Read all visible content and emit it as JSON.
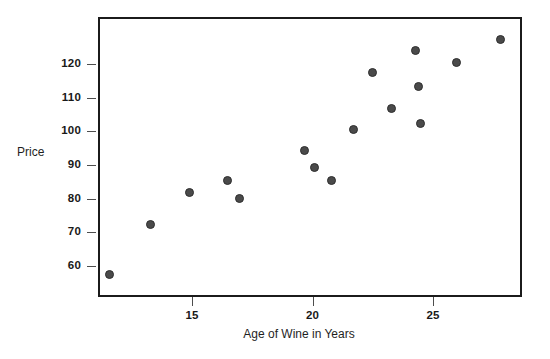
{
  "chart_data": {
    "type": "scatter",
    "title": "",
    "xlabel": "Age of Wine in Years",
    "ylabel": "Price",
    "xlim": [
      11.2,
      28.6
    ],
    "ylim": [
      55.5,
      131
    ],
    "grid": false,
    "legend": null,
    "xticks": [
      15,
      20,
      25
    ],
    "yticks": [
      60,
      70,
      80,
      90,
      100,
      110,
      120
    ],
    "xtick_labels": [
      "15",
      "20",
      "25"
    ],
    "ytick_labels": [
      "60",
      "70",
      "80",
      "90",
      "100",
      "110",
      "120"
    ],
    "marker": {
      "shape": "circle",
      "color": "#4a4a4a",
      "edge_color": "#2e2e2e",
      "size": 9
    },
    "x": [
      11.5,
      13.2,
      14.8,
      16.4,
      16.9,
      19.6,
      20.0,
      20.7,
      21.6,
      22.4,
      23.2,
      24.2,
      24.3,
      24.4,
      25.9,
      27.7
    ],
    "y": [
      58,
      73,
      82.5,
      86,
      80.5,
      95,
      90,
      86,
      101,
      118,
      107.5,
      124.5,
      114,
      103,
      121,
      128
    ],
    "points": [
      {
        "x": 11.5,
        "y": 58
      },
      {
        "x": 13.2,
        "y": 73
      },
      {
        "x": 14.8,
        "y": 82.5
      },
      {
        "x": 16.4,
        "y": 86
      },
      {
        "x": 16.9,
        "y": 80.5
      },
      {
        "x": 19.6,
        "y": 95
      },
      {
        "x": 20.0,
        "y": 90
      },
      {
        "x": 20.7,
        "y": 86
      },
      {
        "x": 21.6,
        "y": 101
      },
      {
        "x": 22.4,
        "y": 118
      },
      {
        "x": 23.2,
        "y": 107.5
      },
      {
        "x": 24.2,
        "y": 124.5
      },
      {
        "x": 24.3,
        "y": 114
      },
      {
        "x": 24.4,
        "y": 103
      },
      {
        "x": 25.9,
        "y": 121
      },
      {
        "x": 27.7,
        "y": 128
      }
    ],
    "colors": {
      "frame": "#1b1b1b",
      "tick": "#4d4d4d",
      "text": "#191919",
      "background": "#ffffff"
    }
  },
  "axes": {
    "y_title": "Price",
    "x_title": "Age of Wine in Years"
  }
}
